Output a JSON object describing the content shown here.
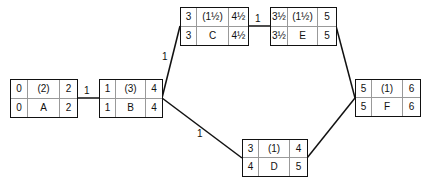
{
  "diagram": {
    "type": "activity-on-node network",
    "nodes": [
      {
        "id": "A",
        "es": "0",
        "duration": "(2)",
        "ef": "2",
        "ls": "0",
        "name": "A",
        "lf": "2"
      },
      {
        "id": "B",
        "es": "1",
        "duration": "(3)",
        "ef": "4",
        "ls": "1",
        "name": "B",
        "lf": "4"
      },
      {
        "id": "C",
        "es": "3",
        "duration": "(1½)",
        "ef": "4½",
        "ls": "3",
        "name": "C",
        "lf": "4½"
      },
      {
        "id": "E",
        "es": "3½",
        "duration": "(1½)",
        "ef": "5",
        "ls": "3½",
        "name": "E",
        "lf": "5"
      },
      {
        "id": "D",
        "es": "3",
        "duration": "(1)",
        "ef": "4",
        "ls": "4",
        "name": "D",
        "lf": "5"
      },
      {
        "id": "F",
        "es": "5",
        "duration": "(1)",
        "ef": "6",
        "ls": "5",
        "name": "F",
        "lf": "6"
      }
    ],
    "edges": [
      {
        "from": "A",
        "to": "B",
        "label": "1"
      },
      {
        "from": "B",
        "to": "C",
        "label": "1"
      },
      {
        "from": "B",
        "to": "D",
        "label": "1"
      },
      {
        "from": "C",
        "to": "E",
        "label": "1"
      },
      {
        "from": "E",
        "to": "F",
        "label": ""
      },
      {
        "from": "D",
        "to": "F",
        "label": ""
      }
    ]
  }
}
